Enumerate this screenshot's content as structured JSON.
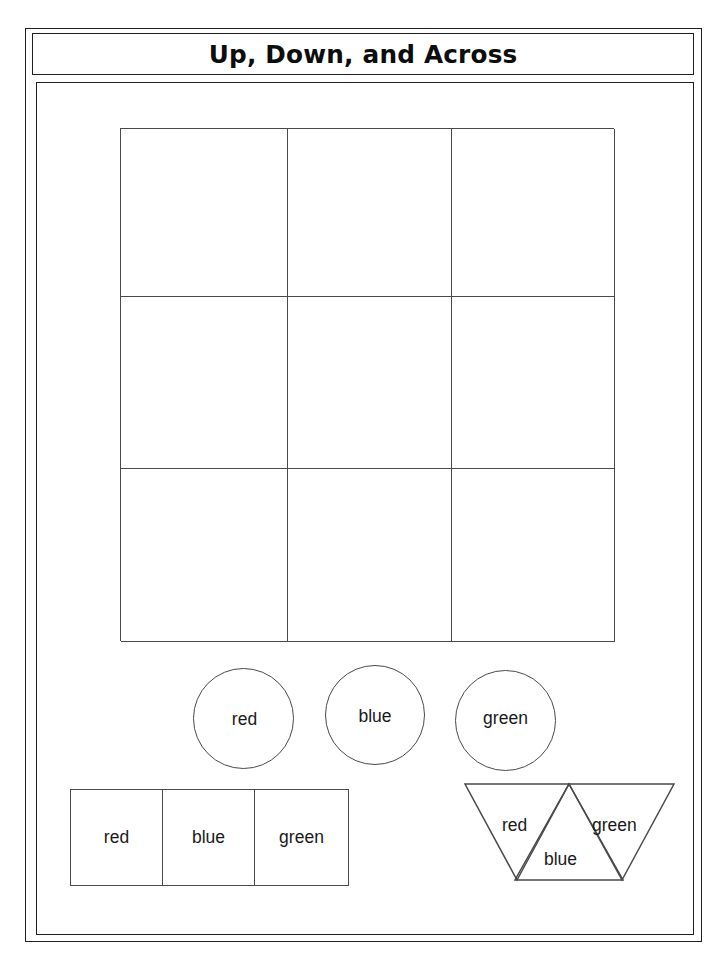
{
  "worksheet": {
    "title": "Up, Down, and Across",
    "grid": {
      "rows": 3,
      "columns": 3,
      "cells": [
        "",
        "",
        "",
        "",
        "",
        "",
        "",
        "",
        ""
      ]
    },
    "circles": [
      {
        "label": "red"
      },
      {
        "label": "blue"
      },
      {
        "label": "green"
      }
    ],
    "squares": [
      {
        "label": "red"
      },
      {
        "label": "blue"
      },
      {
        "label": "green"
      }
    ],
    "triangles": [
      {
        "label": "red"
      },
      {
        "label": "blue"
      },
      {
        "label": "green"
      }
    ]
  }
}
